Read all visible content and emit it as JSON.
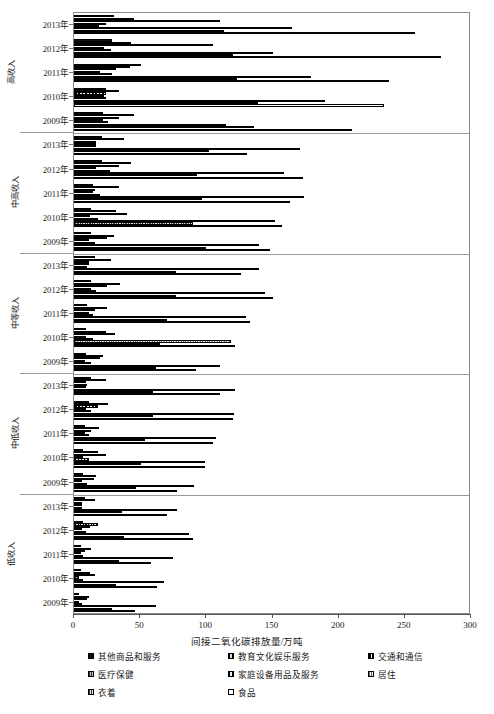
{
  "chart_data": {
    "type": "bar",
    "orientation": "horizontal",
    "title": "",
    "xlabel": "间接二氧化碳排放量/万吨",
    "ylabel": "",
    "xlim": [
      0,
      300
    ],
    "xticks": [
      0,
      50,
      100,
      150,
      200,
      250,
      300
    ],
    "grid": false,
    "legend_position": "bottom",
    "categories": [
      "2013年",
      "2012年",
      "2011年",
      "2010年",
      "2009年"
    ],
    "groups": [
      {
        "label": "高收入",
        "years": [
          "2013年",
          "2012年",
          "2011年",
          "2010年",
          "2009年"
        ],
        "values": {
          "2013年": [
            30,
            45,
            110,
            24,
            19,
            165,
            113,
            258
          ],
          "2012年": [
            29,
            43,
            105,
            23,
            28,
            150,
            120,
            277
          ],
          "2011年": [
            51,
            42,
            32,
            20,
            29,
            179,
            123,
            238
          ],
          "2010年": [
            24,
            34,
            24,
            23,
            24,
            190,
            139,
            234
          ],
          "2009年": [
            22,
            45,
            34,
            22,
            26,
            115,
            136,
            210
          ]
        }
      },
      {
        "label": "中高收入",
        "years": [
          "2013年",
          "2012年",
          "2011年",
          "2010年",
          "2009年"
        ],
        "values": {
          "2013年": [
            21,
            38,
            17,
            17,
            17,
            171,
            102,
            131
          ],
          "2012年": [
            21,
            43,
            34,
            17,
            27,
            159,
            93,
            173
          ],
          "2011年": [
            14,
            34,
            16,
            14,
            20,
            174,
            97,
            163
          ],
          "2010年": [
            13,
            32,
            40,
            12,
            18,
            152,
            90,
            157
          ],
          "2009年": [
            13,
            30,
            25,
            11,
            16,
            140,
            100,
            148
          ]
        }
      },
      {
        "label": "中等收入",
        "years": [
          "2013年",
          "2012年",
          "2011年",
          "2010年",
          "2009年"
        ],
        "values": {
          "2013年": [
            16,
            28,
            11,
            11,
            10,
            140,
            77,
            126
          ],
          "2012年": [
            13,
            35,
            25,
            13,
            17,
            144,
            77,
            150
          ],
          "2011年": [
            10,
            25,
            16,
            11,
            14,
            130,
            70,
            133
          ],
          "2010年": [
            9,
            24,
            31,
            9,
            14,
            119,
            65,
            122
          ],
          "2009年": [
            9,
            22,
            20,
            8,
            13,
            110,
            62,
            92
          ]
        }
      },
      {
        "label": "中低收入",
        "years": [
          "2013年",
          "2012年",
          "2011年",
          "2010年",
          "2009年"
        ],
        "values": {
          "2013年": [
            13,
            24,
            9,
            10,
            9,
            122,
            60,
            110
          ],
          "2012年": [
            11,
            26,
            18,
            9,
            13,
            121,
            60,
            120
          ],
          "2011年": [
            8,
            19,
            13,
            8,
            11,
            107,
            54,
            105
          ],
          "2010年": [
            7,
            18,
            24,
            7,
            11,
            99,
            51,
            99
          ],
          "2009年": [
            7,
            17,
            15,
            6,
            10,
            91,
            47,
            78
          ]
        }
      },
      {
        "label": "低收入",
        "years": [
          "2013年",
          "2012年",
          "2011年",
          "2010年",
          "2009年"
        ],
        "values": {
          "2013年": [
            8,
            16,
            6,
            6,
            6,
            78,
            36,
            70
          ],
          "2012年": [
            7,
            18,
            12,
            6,
            9,
            87,
            38,
            90
          ],
          "2011年": [
            5,
            13,
            8,
            5,
            7,
            75,
            34,
            58
          ],
          "2010年": [
            5,
            12,
            16,
            4,
            7,
            68,
            32,
            63
          ],
          "2009年": [
            4,
            11,
            10,
            4,
            6,
            62,
            29,
            46
          ]
        }
      }
    ],
    "series": [
      {
        "name": "其他商品和服务",
        "pattern": "solid-black"
      },
      {
        "name": "教育文化娱乐服务",
        "pattern": "fine-vertical-hatch"
      },
      {
        "name": "交通和通信",
        "pattern": "coarse-vertical-hatch"
      },
      {
        "name": "医疗保健",
        "pattern": "dense-dot-hatch"
      },
      {
        "name": "家庭设备用品及服务",
        "pattern": "checker-hatch"
      },
      {
        "name": "居住",
        "pattern": "light-grey-dotted"
      },
      {
        "name": "衣着",
        "pattern": "medium-grey-hatch"
      },
      {
        "name": "食品",
        "pattern": "open-white"
      }
    ]
  },
  "legend": {
    "items": [
      "其他商品和服务",
      "教育文化娱乐服务",
      "交通和通信",
      "医疗保健",
      "家庭设备用品及服务",
      "居住",
      "衣着",
      "食品"
    ]
  }
}
